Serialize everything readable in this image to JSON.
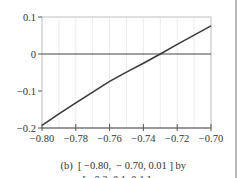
{
  "chart_data": {
    "type": "line",
    "title": "",
    "xlabel": "",
    "ylabel": "",
    "xlim": [
      -0.8,
      -0.7
    ],
    "ylim": [
      -0.2,
      0.1
    ],
    "x_ticks": [
      -0.8,
      -0.78,
      -0.76,
      -0.74,
      -0.72,
      -0.7
    ],
    "x_tick_labels": [
      "−0.80",
      "−0.78",
      "−0.76",
      "−0.74",
      "−0.72",
      "−0.70"
    ],
    "y_ticks": [
      0.1,
      0,
      -0.1,
      -0.2
    ],
    "y_tick_labels": [
      "0.1",
      "0",
      "−0.1",
      "−0.2"
    ],
    "grid": {
      "vertical": true,
      "horizontal": false,
      "vertical_step": 0.01
    },
    "reference_lines": [
      {
        "axis": "y",
        "value": 0
      }
    ],
    "series": [
      {
        "name": "f(x)",
        "x": [
          -0.8,
          -0.79,
          -0.78,
          -0.77,
          -0.76,
          -0.75,
          -0.74,
          -0.73,
          -0.72,
          -0.71,
          -0.7
        ],
        "y": [
          -0.193,
          -0.162,
          -0.132,
          -0.103,
          -0.074,
          -0.049,
          -0.025,
          0.0,
          0.026,
          0.051,
          0.076
        ]
      }
    ],
    "root_approx": -0.731,
    "legend": null
  },
  "caption": {
    "label": "(b)",
    "line1": "[ −0.80,  − 0.70, 0.01 ] by",
    "line2": "[ −0.2, 0.1, 0.1 ]"
  },
  "colors": {
    "curve": "#3a3a3a",
    "axis": "#555555",
    "frame": "#bdbdbd",
    "grid": "#ececec",
    "zero_line": "#444444",
    "divider": "#b8b8b8"
  }
}
